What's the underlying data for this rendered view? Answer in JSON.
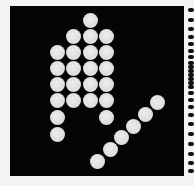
{
  "image": {
    "description": "Black square panel with a pattern of light gray circular dots forming a raised hand shape and a diagonal line of dots; perforation-like black marks along right edge",
    "colors": {
      "background": "#f4f4f2",
      "panel": "#050505",
      "dot": "#dcdcdc",
      "edge_mark": "#111111"
    },
    "panel": {
      "x": 10,
      "y": 6,
      "width": 174,
      "height": 170
    },
    "dot_diameter": 15,
    "dots": [
      {
        "cx": 90,
        "cy": 20
      },
      {
        "cx": 73,
        "cy": 36
      },
      {
        "cx": 90,
        "cy": 36
      },
      {
        "cx": 106,
        "cy": 36
      },
      {
        "cx": 57,
        "cy": 52
      },
      {
        "cx": 73,
        "cy": 52
      },
      {
        "cx": 90,
        "cy": 52
      },
      {
        "cx": 106,
        "cy": 52
      },
      {
        "cx": 57,
        "cy": 68
      },
      {
        "cx": 73,
        "cy": 68
      },
      {
        "cx": 90,
        "cy": 68
      },
      {
        "cx": 106,
        "cy": 68
      },
      {
        "cx": 57,
        "cy": 84
      },
      {
        "cx": 73,
        "cy": 84
      },
      {
        "cx": 90,
        "cy": 84
      },
      {
        "cx": 106,
        "cy": 84
      },
      {
        "cx": 57,
        "cy": 100
      },
      {
        "cx": 73,
        "cy": 100
      },
      {
        "cx": 90,
        "cy": 100
      },
      {
        "cx": 106,
        "cy": 100
      },
      {
        "cx": 57,
        "cy": 117
      },
      {
        "cx": 106,
        "cy": 117
      },
      {
        "cx": 57,
        "cy": 134
      },
      {
        "cx": 157,
        "cy": 102
      },
      {
        "cx": 145,
        "cy": 114
      },
      {
        "cx": 133,
        "cy": 126
      },
      {
        "cx": 121,
        "cy": 137
      },
      {
        "cx": 110,
        "cy": 149
      },
      {
        "cx": 97,
        "cy": 161
      }
    ],
    "edge_marks_y": [
      10,
      20,
      29,
      37,
      44,
      51,
      57,
      63,
      67,
      71,
      75,
      79,
      83,
      87,
      93,
      100,
      107,
      115,
      124,
      134,
      144,
      154,
      163,
      171
    ]
  }
}
